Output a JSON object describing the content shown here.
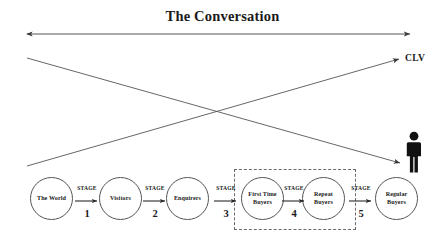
{
  "diagram": {
    "title": "The Conversation",
    "clv_label": "CLV",
    "person_icon": "person-icon",
    "horizontal_axis": {
      "name": "conversation-axis",
      "style": "double-headed-arrow"
    },
    "crossing_arrows": [
      {
        "name": "clv-ascending-arrow",
        "target_label": "CLV"
      },
      {
        "name": "customer-descending-arrow",
        "target_label": "person-icon"
      }
    ],
    "highlight_box": {
      "name": "buyer-conversion-zone",
      "style": "dashed"
    },
    "nodes": [
      {
        "id": "the-world",
        "label": "The World",
        "cx": 52,
        "cy": 199
      },
      {
        "id": "visitors",
        "label": "Visitors",
        "cx": 121,
        "cy": 199
      },
      {
        "id": "enquirers",
        "label": "Enquirers",
        "cx": 188,
        "cy": 199
      },
      {
        "id": "first-time-buyers",
        "label": "First Time\nBuyers",
        "line1": "First Time",
        "line2": "Buyers",
        "cx": 263,
        "cy": 199
      },
      {
        "id": "repeat-buyers",
        "label": "Repeat\nBuyers",
        "line1": "Repeat",
        "line2": "Buyers",
        "cx": 324,
        "cy": 199
      },
      {
        "id": "regular-buyers",
        "label": "Regular\nBuyers",
        "line1": "Regular",
        "line2": "Buyers",
        "cx": 397,
        "cy": 199
      }
    ],
    "stages": [
      {
        "id": "stage-1",
        "word": "STAGE",
        "number": "1",
        "x": 87
      },
      {
        "id": "stage-2",
        "word": "STAGE",
        "number": "2",
        "x": 155
      },
      {
        "id": "stage-3",
        "word": "STAGE",
        "number": "3",
        "x": 226
      },
      {
        "id": "stage-4",
        "word": "STAGE",
        "number": "4",
        "x": 294
      },
      {
        "id": "stage-5",
        "word": "STAGE",
        "number": "5",
        "x": 361
      }
    ],
    "colors": {
      "ink": "#1a1a1a",
      "line": "#555555",
      "dashed": "#6a6a6a",
      "background": "#ffffff"
    }
  }
}
